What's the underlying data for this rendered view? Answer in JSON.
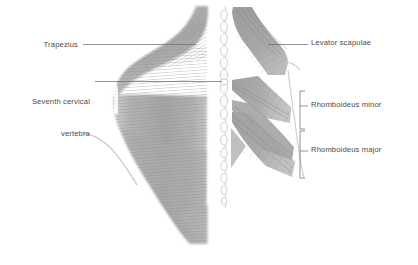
{
  "figure": {
    "background_color": "#ffffff",
    "width": 418,
    "height": 265,
    "line_color": "#6e6e6e",
    "text_color": "#4a4a4a",
    "muscle_fill": "#a9a9a9",
    "muscle_fill_dark": "#9a9a9a",
    "muscle_fill_light": "#c2c2c2",
    "spine_fill": "#fdfdfd",
    "spine_stroke": "#cfcfcf"
  },
  "labels": {
    "trapezius": {
      "text": "Trapezius",
      "align": "right"
    },
    "seventh_cervical_vertebra": {
      "line1": "Seventh cervical",
      "line2": "vertebra",
      "align": "right"
    },
    "levator_scapulae": {
      "text": "Levator scapulae",
      "align": "left"
    },
    "rhomboideus_minor": {
      "text": "Rhomboideus minor",
      "align": "left"
    },
    "rhomboideus_major": {
      "text": "Rhomboideus major",
      "align": "left"
    }
  },
  "structures": [
    {
      "name": "trapezius",
      "side": "left"
    },
    {
      "name": "seventh-cervical-vertebra",
      "side": "center"
    },
    {
      "name": "vertebral-column",
      "side": "center"
    },
    {
      "name": "levator-scapulae",
      "side": "right"
    },
    {
      "name": "rhomboideus-minor",
      "side": "right"
    },
    {
      "name": "rhomboideus-major",
      "side": "right"
    }
  ]
}
